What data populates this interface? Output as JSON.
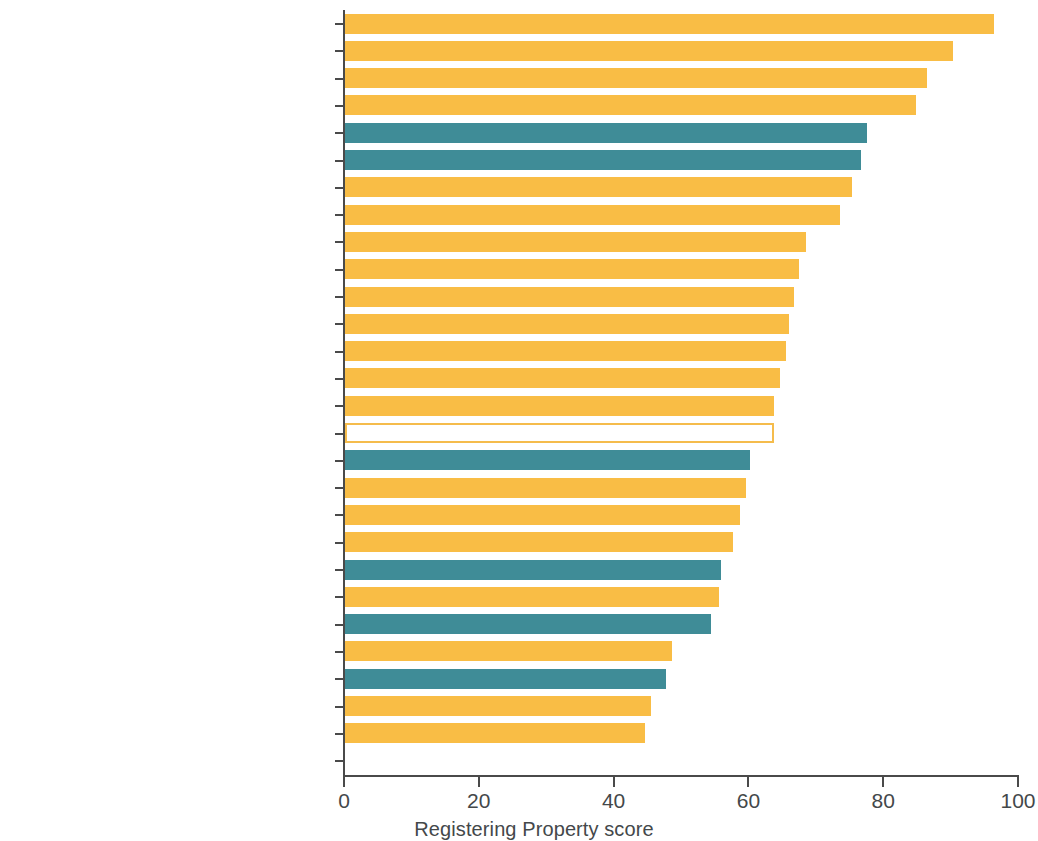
{
  "chart_data": {
    "type": "bar",
    "orientation": "horizontal",
    "title": "",
    "xlabel": "Registering Property score",
    "ylabel": "",
    "xlim": [
      0,
      100
    ],
    "xticks": [
      0,
      20,
      40,
      60,
      80,
      100
    ],
    "grid": false,
    "legend": null,
    "categories": [
      "Qatar",
      "United Arab Emirates",
      "Bahrain",
      "Saudi Arabia",
      "North America",
      "Europe and Central Asia",
      "Kuwait",
      "Oman",
      "Iran, Islamic Rep.",
      "Israel",
      "Jordan",
      "Morocco",
      "Yemen, Rep.",
      "West Bank and Gaza",
      "Tunisia",
      "Middle East and North Africa",
      "East Asia and Pacific",
      "Lebanon",
      "Djibouti",
      "Iraq",
      "Latin American and the Caribbean",
      "Egypt, Arab Rep.",
      "Sub-Saharan Africa",
      "Malta",
      "South Asia",
      "Syrian Arab Republic",
      "Algeria",
      "Libya"
    ],
    "values": [
      96.3,
      90.2,
      86.3,
      84.7,
      77.4,
      76.6,
      75.2,
      73.4,
      68.4,
      67.4,
      66.6,
      65.9,
      65.4,
      64.5,
      63.6,
      63.6,
      60.1,
      59.5,
      58.6,
      57.6,
      55.8,
      55.5,
      54.3,
      48.5,
      47.6,
      45.4,
      44.5,
      0
    ],
    "bar_styles": [
      "amber",
      "amber",
      "amber",
      "amber",
      "teal",
      "teal",
      "amber",
      "amber",
      "amber",
      "amber",
      "amber",
      "amber",
      "amber",
      "amber",
      "amber",
      "amber-outline",
      "teal",
      "amber",
      "amber",
      "amber",
      "teal",
      "amber",
      "teal",
      "amber",
      "teal",
      "amber",
      "amber",
      "amber"
    ],
    "colors": {
      "amber": "#f9bd45",
      "teal": "#3f8c97",
      "amber_outline_stroke": "#f5bc4c",
      "axis": "#4a4a4a",
      "text": "#44484a",
      "background": "#ffffff"
    }
  }
}
